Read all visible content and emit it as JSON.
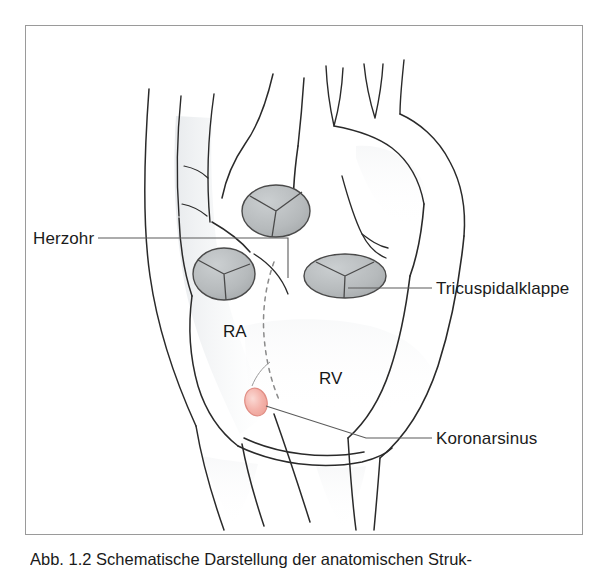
{
  "figure": {
    "frame": {
      "border_color": "#9a9a9a",
      "background": "#ffffff"
    },
    "caption": "Abb. 1.2 Schematische Darstellung der anatomischen Struk-",
    "title_alt": "Schematische Darstellung des rechten Herzens",
    "colors": {
      "outline": "#2a2a2a",
      "valve_fill": "#b9bcbd",
      "valve_stroke": "#4a4a4a",
      "shading": "#eceef0",
      "coronary_sinus_fill": "#f4b3ab",
      "coronary_sinus_stroke": "#e08d84",
      "leader_line": "#5b5b5b",
      "dashed_septum": "#8a8a8a",
      "text": "#1b1b1b"
    },
    "labels": [
      {
        "id": "herzohr",
        "text": "Herzohr",
        "side": "left",
        "x": 33,
        "y": 230
      },
      {
        "id": "tricuspidalklappe",
        "text": "Tricuspidalklappe",
        "side": "right",
        "x": 436,
        "y": 280
      },
      {
        "id": "koronarsinus",
        "text": "Koronarsinus",
        "side": "right",
        "x": 436,
        "y": 430
      }
    ],
    "chambers": [
      {
        "id": "ra",
        "text": "RA",
        "x": 222,
        "y": 310,
        "full_name": "rechter Vorhof"
      },
      {
        "id": "rv",
        "text": "RV",
        "x": 318,
        "y": 357,
        "full_name": "rechte Kammer"
      }
    ],
    "structures": [
      {
        "id": "superior-vena-cava",
        "name": "obere Hohlvene"
      },
      {
        "id": "aortic-arch",
        "name": "Aortenbogen"
      },
      {
        "id": "pulmonary-artery",
        "name": "Pulmonalarterie"
      },
      {
        "id": "right-atrium",
        "name": "rechter Vorhof"
      },
      {
        "id": "right-ventricle",
        "name": "rechte Kammer"
      },
      {
        "id": "inferior-vena-cava",
        "name": "untere Hohlvene"
      },
      {
        "id": "valve-tricuspid",
        "name": "Tricuspidalklappe"
      },
      {
        "id": "valve-pulmonary",
        "name": "Pulmonalklappe"
      },
      {
        "id": "valve-aortic",
        "name": "Aortenklappe"
      },
      {
        "id": "coronary-sinus",
        "name": "Koronarsinus"
      },
      {
        "id": "atrial-appendage",
        "name": "Herzohr"
      }
    ]
  }
}
